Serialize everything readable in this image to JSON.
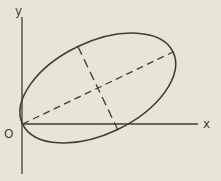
{
  "diagram": {
    "labels": {
      "y_axis": "y",
      "x_axis": "x",
      "origin": "O"
    },
    "colors": {
      "background": "#e8e4d6",
      "line": "#3f3d36"
    },
    "axes": {
      "y_axis": {
        "x": 22,
        "y1": 17,
        "y2": 174
      },
      "x_axis": {
        "y": 124,
        "x1": 22,
        "x2": 198
      }
    },
    "ellipse": {
      "cx": 97.8,
      "cy": 88,
      "rx": 83.4,
      "ry": 46,
      "rotation_deg": -25.6,
      "stroke_width": 1.6
    },
    "dashed_major_axis": {
      "x1": 22.6,
      "y1": 124,
      "x2": 173,
      "y2": 52,
      "dash": "7 4.5",
      "stroke_width": 1.3
    },
    "dashed_minor_axis": {
      "x1": 77.9,
      "y1": 46.5,
      "x2": 117.7,
      "y2": 129.5,
      "dash": "9 5",
      "stroke_width": 1.3
    },
    "axis_stroke_width": 1.3,
    "label_positions": {
      "y": {
        "x": 15,
        "y": 15
      },
      "x": {
        "x": 203,
        "y": 128
      },
      "o": {
        "x": 4,
        "y": 138
      }
    }
  }
}
